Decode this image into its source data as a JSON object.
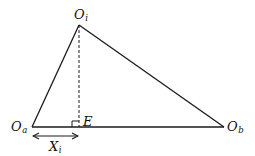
{
  "diagram": {
    "type": "triangle-geometry",
    "colors": {
      "line": "#1a1a1a",
      "background": "#ffffff"
    },
    "vertices": {
      "apex": {
        "main": "O",
        "sub": "i",
        "x": 79,
        "y": 25
      },
      "left": {
        "main": "O",
        "sub": "a",
        "x": 32,
        "y": 127
      },
      "right": {
        "main": "O",
        "sub": "b",
        "x": 224,
        "y": 127
      }
    },
    "foot": {
      "label": "E",
      "x": 79,
      "y": 127
    },
    "altitude": {
      "style": "dashed",
      "from": "apex",
      "to": "foot"
    },
    "right_angle_marker": {
      "at": "foot"
    },
    "dimension": {
      "main": "X",
      "sub": "i",
      "from": "left",
      "to": "foot",
      "style": "double-arrow"
    }
  }
}
